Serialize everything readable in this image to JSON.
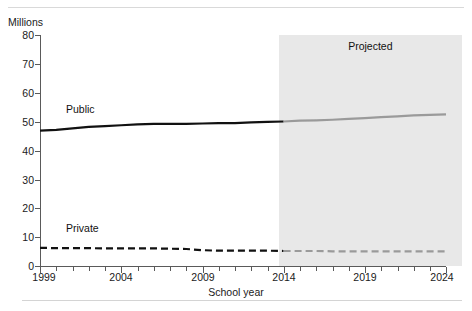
{
  "chart_data": {
    "type": "line",
    "title": "",
    "xlabel": "School year",
    "ylabel": "Millions",
    "ylim": [
      0,
      80
    ],
    "xlim": [
      1999,
      2024
    ],
    "yticks": [
      0,
      10,
      20,
      30,
      40,
      50,
      60,
      70,
      80
    ],
    "xticks": [
      1999,
      2004,
      2009,
      2014,
      2019,
      2024
    ],
    "xtick_minor_step": 1,
    "grid": false,
    "legend_position": "inline-annotation",
    "annotations": [
      {
        "text": "Projected",
        "x": 2018,
        "y": 77,
        "name": "projected-band-label"
      },
      {
        "text": "Public",
        "x": 2002,
        "y": 56,
        "name": "public-series-label"
      },
      {
        "text": "Private",
        "x": 2002,
        "y": 15,
        "name": "private-series-label"
      }
    ],
    "shaded_region": {
      "label": "Projected",
      "x_start": 2013.7,
      "x_end": 2024,
      "color": "#e8e8e8"
    },
    "x": [
      1999,
      2000,
      2001,
      2002,
      2003,
      2004,
      2005,
      2006,
      2007,
      2008,
      2009,
      2010,
      2011,
      2012,
      2013,
      2014,
      2015,
      2016,
      2017,
      2018,
      2019,
      2020,
      2021,
      2022,
      2023,
      2024
    ],
    "series": [
      {
        "name": "Public",
        "color": "#111111",
        "projected_color": "#9a9a9a",
        "style": "solid",
        "values": [
          46.9,
          47.2,
          47.7,
          48.2,
          48.5,
          48.8,
          49.1,
          49.3,
          49.3,
          49.3,
          49.4,
          49.5,
          49.5,
          49.8,
          50.0,
          50.1,
          50.4,
          50.5,
          50.7,
          51.0,
          51.3,
          51.6,
          51.9,
          52.2,
          52.4,
          52.6
        ]
      },
      {
        "name": "Private",
        "color": "#111111",
        "projected_color": "#9a9a9a",
        "style": "dashed",
        "values": [
          6.3,
          6.2,
          6.2,
          6.2,
          6.1,
          6.1,
          6.1,
          6.1,
          6.0,
          5.9,
          5.5,
          5.3,
          5.3,
          5.3,
          5.3,
          5.2,
          5.2,
          5.2,
          5.1,
          5.1,
          5.1,
          5.1,
          5.1,
          5.1,
          5.1,
          5.1
        ]
      }
    ],
    "projection_start_year": 2014
  },
  "labels": {
    "y_axis_title": "Millions",
    "x_axis_title": "School year",
    "projected": "Projected",
    "public": "Public",
    "private": "Private",
    "ytick_0": "0",
    "ytick_10": "10",
    "ytick_20": "20",
    "ytick_30": "30",
    "ytick_40": "40",
    "ytick_50": "50",
    "ytick_60": "60",
    "ytick_70": "70",
    "ytick_80": "80",
    "xtick_1999": "1999",
    "xtick_2004": "2004",
    "xtick_2009": "2009",
    "xtick_2014": "2014",
    "xtick_2019": "2019",
    "xtick_2024": "2024"
  },
  "colors": {
    "actual_line": "#111111",
    "projected_line": "#9a9a9a",
    "projected_band": "#e8e8e8",
    "axis": "#5a5a5a",
    "rule": "#d9d9d9"
  }
}
